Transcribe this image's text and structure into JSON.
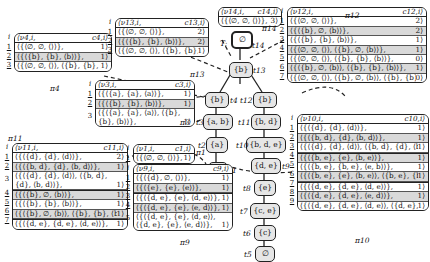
{
  "tree": {
    "root_label": "T:",
    "nodes": [
      {
        "id": "t14",
        "set": "∅",
        "label": "t14"
      },
      {
        "id": "t13",
        "set": "{b}",
        "label": "t13"
      },
      {
        "id": "t4",
        "set": "{b}",
        "label": "t4"
      },
      {
        "id": "t12",
        "set": "{b}",
        "label": "t12"
      },
      {
        "id": "t3",
        "set": "{a, b}",
        "label": "t3"
      },
      {
        "id": "t11",
        "set": "{b, d}",
        "label": "t11"
      },
      {
        "id": "t2",
        "set": "{a}",
        "label": "t2"
      },
      {
        "id": "t10",
        "set": "{b, d, e}",
        "label": "t10"
      },
      {
        "id": "t1",
        "set": "∅",
        "label": "t1"
      },
      {
        "id": "t9",
        "set": "{d, e}",
        "label": "t9"
      },
      {
        "id": "t8",
        "set": "{e}",
        "label": "t8"
      },
      {
        "id": "t7",
        "set": "{c, e}",
        "label": "t7"
      },
      {
        "id": "t6",
        "set": "{c}",
        "label": "t6"
      },
      {
        "id": "t5",
        "set": "∅",
        "label": "t5"
      }
    ]
  },
  "tables": {
    "pi4": {
      "name": "π4",
      "h_nu": "⟨ν4,i,",
      "h_c": "c4,i⟩",
      "rows": [
        {
          "i": "1",
          "v": "⟨{⟨∅, ∅, ⟨⟩⟩},",
          "c": "1⟩"
        },
        {
          "i": "2",
          "v": "⟨{⟨{b}, {b}, ⟨b⟩⟩},",
          "c": "1⟩"
        },
        {
          "i": "3",
          "v": "⟨{⟨∅, ∅, ⟨⟩⟩, ⟨{b}, {b}, ⟨b⟩⟩},",
          "c": "1⟩"
        }
      ]
    },
    "pi13": {
      "name": "π13",
      "h_nu": "⟨ν13,i,",
      "h_c": "c13,i⟩",
      "rows": [
        {
          "i": "1",
          "v": "⟨{⟨∅, ∅, ⟨⟩⟩},",
          "c": "2⟩"
        },
        {
          "i": "2",
          "v": "⟨{⟨{b}, {b}, ⟨b⟩⟩},",
          "c": "2⟩"
        },
        {
          "i": "3",
          "v": "⟨{⟨∅, ∅, ⟨⟩⟩, ⟨{b}, {b}, ⟨b⟩⟩},",
          "c": "1⟩"
        }
      ]
    },
    "pi14": {
      "name": "π14",
      "h_nu": "⟨ν14,i,",
      "h_c": "c14,i⟩",
      "rows": [
        {
          "i": "",
          "v": "⟨{⟨∅, ∅, ⟨⟩⟩},",
          "c": "3⟩"
        }
      ]
    },
    "pi12": {
      "name": "π12",
      "h_nu": "⟨ν12,i,",
      "h_c": "c12,i⟩",
      "rows": [
        {
          "i": "1",
          "v": "⟨{⟨∅, ∅, ⟨⟩⟩},",
          "c": "2⟩"
        },
        {
          "i": "2",
          "v": "⟨{⟨{b}, ∅, ⟨b⟩⟩},",
          "c": "2⟩"
        },
        {
          "i": "3",
          "v": "⟨{⟨{b}, {b}, ⟨b⟩⟩},",
          "c": "1⟩"
        },
        {
          "i": "4",
          "v": "⟨{⟨∅, ∅, ⟨⟩⟩, ⟨{b}, ∅, ⟨b⟩⟩},",
          "c": "1⟩"
        },
        {
          "i": "5",
          "v": "⟨{⟨∅, ∅, ⟨⟩⟩, ⟨{b}, {b}, ⟨b⟩⟩},",
          "c": "0⟩"
        },
        {
          "i": "6",
          "v": "⟨{⟨{b}, ∅, ⟨b⟩⟩, ⟨{b}, {b}, ⟨b⟩⟩},",
          "c": "1⟩"
        },
        {
          "i": "7",
          "v": "⟨{⟨∅, ∅, ⟨⟩⟩, ⟨{b}, ∅, ⟨b⟩⟩, ⟨{b}, {b}, ⟨b⟩⟩},",
          "c": "0⟩"
        }
      ]
    },
    "pi3": {
      "name": "π3",
      "h_nu": "⟨ν3,i,",
      "h_c": "c3,i⟩",
      "rows": [
        {
          "i": "1",
          "v": "⟨{⟨{a}, {a}, ⟨a⟩⟩},",
          "c": "1⟩"
        },
        {
          "i": "2",
          "v": "⟨{⟨{b}, {b}, ⟨b⟩⟩},",
          "c": "1⟩"
        },
        {
          "i": "3",
          "v": "⟨{⟨{a}, {a}, ⟨a⟩⟩, ⟨{b}, {b}, ⟨b⟩⟩},",
          "c": "1⟩"
        }
      ]
    },
    "pi11": {
      "name": "π11",
      "h_nu": "⟨ν11,i,",
      "h_c": "c11,i⟩",
      "rows": [
        {
          "i": "1",
          "v": "⟨{⟨{d}, {d}, ⟨d⟩⟩},",
          "c": "2⟩"
        },
        {
          "i": "2",
          "v": "⟨{⟨{b, d}, {d}, ⟨b, d⟩⟩},",
          "c": "1⟩"
        },
        {
          "i": "3",
          "v": "⟨{⟨{d}, {d}, ⟨d⟩⟩, ⟨{b, d}, {d}, ⟨b, d⟩⟩},",
          "c": "1⟩"
        },
        {
          "i": "4",
          "v": "⟨{⟨{b}, ∅, ⟨b⟩⟩},",
          "c": "1⟩"
        },
        {
          "i": "5",
          "v": "⟨{⟨{b}, {b}, ⟨b⟩⟩},",
          "c": "1⟩"
        },
        {
          "i": "6",
          "v": "⟨{⟨{b}, ∅, ⟨b⟩⟩, ⟨{b}, {b}, ⟨b⟩⟩},",
          "c": "1⟩"
        },
        {
          "i": "7",
          "v": "⟨{⟨{d, e}, {d, e}, ⟨d, e⟩⟩},",
          "c": "1⟩"
        }
      ]
    },
    "pi1": {
      "name": "π1",
      "h_nu": "⟨ν1,i,",
      "h_c": "c1,i⟩",
      "rows": [
        {
          "i": "1",
          "v": "⟨{⟨∅, ∅, ⟨⟩⟩},",
          "c": "1⟩"
        }
      ]
    },
    "pi9": {
      "name": "π9",
      "h_nu": "⟨ν9,i,",
      "h_c": "c9,i⟩",
      "rows": [
        {
          "i": "1",
          "v": "⟨{⟨{d}, ∅, ⟨⟩⟩},",
          "c": "1⟩"
        },
        {
          "i": "2",
          "v": "⟨{⟨{e}, {e}, ⟨e⟩⟩},",
          "c": "1⟩"
        },
        {
          "i": "3",
          "v": "⟨{⟨{d, e}, {e}, ⟨d, e⟩⟩},",
          "c": "1⟩"
        },
        {
          "i": "4",
          "v": "⟨{⟨{d, e}, {e}, ⟨e, d⟩⟩},",
          "c": "1⟩"
        },
        {
          "i": "5",
          "v": "⟨{⟨{d, e}, {e}, ⟨d, e⟩⟩, ⟨{d, e}, {e}, ⟨e, d⟩⟩},",
          "c": "1⟩"
        }
      ]
    },
    "pi10": {
      "name": "π10",
      "h_nu": "⟨ν10,i,",
      "h_c": "c10,i⟩",
      "rows": [
        {
          "i": "1",
          "v": "⟨{⟨{d}, {d}, ⟨d⟩⟩},",
          "c": "1⟩"
        },
        {
          "i": "2",
          "v": "⟨{⟨{b, d}, {d}, ⟨b, d⟩⟩},",
          "c": "1⟩"
        },
        {
          "i": "3",
          "v": "⟨{⟨{d}, {d}, ⟨d⟩⟩, ⟨{b, d}, {d}, ⟨b, d⟩⟩},",
          "c": "1⟩"
        },
        {
          "i": "4",
          "v": "⟨{⟨{b, e}, {e}, ⟨b, e⟩⟩},",
          "c": "1⟩"
        },
        {
          "i": "5",
          "v": "⟨{⟨{b, e}, {b, e}, ⟨e, b⟩⟩},",
          "c": "1⟩"
        },
        {
          "i": "6",
          "v": "⟨{⟨{b, e}, {e}, ⟨b, e⟩⟩, ⟨{b, e}, {b, e}, ⟨e, b⟩⟩},",
          "c": "1⟩"
        },
        {
          "i": "7",
          "v": "⟨{⟨{d, e}, {d, e}, ⟨d, e⟩⟩},",
          "c": "1⟩"
        },
        {
          "i": "8",
          "v": "⟨{⟨{d, e}, {d, e}, ⟨e, d⟩⟩},",
          "c": "1⟩"
        },
        {
          "i": "9",
          "v": "⟨{⟨{d, e}, {d, e}, ⟨d, e⟩⟩, ⟨{d, e}, {d, e}, ⟨e, d⟩⟩},",
          "c": "1⟩"
        }
      ]
    }
  }
}
